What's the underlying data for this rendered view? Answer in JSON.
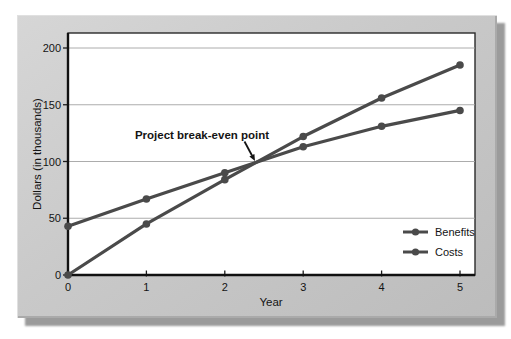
{
  "figure": {
    "y_axis_title": "Dollars (in thousands)",
    "x_axis_title": "Year",
    "annotation_text": "Project break-even point"
  },
  "chart_data": {
    "type": "line",
    "title": "",
    "xlabel": "Year",
    "ylabel": "Dollars (in thousands)",
    "x": [
      0,
      1,
      2,
      3,
      4,
      5
    ],
    "x_tick_labels": [
      "0",
      "1",
      "2",
      "3",
      "4",
      "5"
    ],
    "y_tick_values": [
      0,
      50,
      100,
      150,
      200
    ],
    "y_tick_labels": [
      "0",
      "50",
      "100",
      "150",
      "200"
    ],
    "xlim": [
      0,
      5.2
    ],
    "ylim": [
      0,
      212
    ],
    "grid": "horizontal-only",
    "legend_position": "inside-right-bottom",
    "series": [
      {
        "name": "Benefits",
        "color": "#4a4a4a",
        "marker": "circle",
        "values": [
          0,
          45,
          84,
          122,
          156,
          185
        ]
      },
      {
        "name": "Costs",
        "color": "#4a4a4a",
        "marker": "circle",
        "values": [
          43,
          67,
          90,
          113,
          131,
          145
        ]
      }
    ],
    "annotation": {
      "text": "Project break-even point",
      "x": 2.4,
      "y": 98
    }
  },
  "style": {
    "line_color": "#4a4a4a",
    "grid_color": "#a3a3a3",
    "axis_color": "#111111",
    "panel_color": "#c9c9c9",
    "shadow_color": "#9b9b9b",
    "plot_background": "#ffffff",
    "text_color": "#141414"
  }
}
